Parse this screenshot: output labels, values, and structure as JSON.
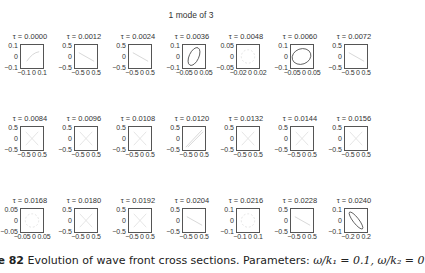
{
  "figure": {
    "suptitle": "1 mode of 3",
    "caption_label": "re 82",
    "caption_text": "Evolution of wave front cross sections. Parameters:",
    "caption_params": "ω/k₁ = 0.1, ω/k₂ = 0"
  },
  "chart_data": {
    "type": "line",
    "title": "1 mode of 3",
    "layout": "3 rows x 7 columns of small subplots",
    "xlabel": "",
    "ylabel": "",
    "grid": false,
    "panels": [
      {
        "title": "τ = 0.0000",
        "yticks": [
          "0.1",
          "0",
          "−0.1"
        ],
        "xticks": "−0.1 0 0.1",
        "shape": "faint-curve"
      },
      {
        "title": "τ = 0.0012",
        "yticks": [
          "0.5",
          "0",
          "−0.5"
        ],
        "xticks": "−0.5 0 0.5",
        "shape": "faint-line"
      },
      {
        "title": "τ = 0.0024",
        "yticks": [
          "0.5",
          "0",
          "−0.5"
        ],
        "xticks": "−0.5 0 0.5",
        "shape": "faint-line"
      },
      {
        "title": "τ = 0.0036",
        "yticks": [
          "0.1",
          "0",
          "−0.1"
        ],
        "xticks": "−0.05 0 0.05",
        "shape": "ellipse-tilted"
      },
      {
        "title": "τ = 0.0048",
        "yticks": [
          "0.05",
          "0",
          "−0.05"
        ],
        "xticks": "−0.02 0 0.02",
        "shape": "faint-ring"
      },
      {
        "title": "τ = 0.0060",
        "yticks": [
          "0.1",
          "0",
          "−0.1"
        ],
        "xticks": "−0.05 0 0.05",
        "shape": "ellipse-wide"
      },
      {
        "title": "τ = 0.0072",
        "yticks": [
          "0.5",
          "0",
          "−0.5"
        ],
        "xticks": "−0.5 0 0.5",
        "shape": "faint-line"
      },
      {
        "title": "τ = 0.0084",
        "yticks": [
          "0.5",
          "0",
          "−0.5"
        ],
        "xticks": "−0.5 0 0.5",
        "shape": "faint-x"
      },
      {
        "title": "τ = 0.0096",
        "yticks": [
          "0.5",
          "0",
          "−0.5"
        ],
        "xticks": "−0.5 0 0.5",
        "shape": "faint-x"
      },
      {
        "title": "τ = 0.0108",
        "yticks": [
          "0.5",
          "0",
          "−0.5"
        ],
        "xticks": "−0.5 0 0.5",
        "shape": "faint-x"
      },
      {
        "title": "τ = 0.0120",
        "yticks": [
          "0.5",
          "0",
          "−0.5"
        ],
        "xticks": "−0.5 0 0.5",
        "shape": "diagonal"
      },
      {
        "title": "τ = 0.0132",
        "yticks": [
          "0.5",
          "0",
          "−0.5"
        ],
        "xticks": "−0.5 0 0.5",
        "shape": "faint-x"
      },
      {
        "title": "τ = 0.0144",
        "yticks": [
          "0.5",
          "0",
          "−0.5"
        ],
        "xticks": "−0.5 0 0.5",
        "shape": "faint-x"
      },
      {
        "title": "τ = 0.0156",
        "yticks": [
          "0.5",
          "0",
          "−0.5"
        ],
        "xticks": "−0.5 0 0.5",
        "shape": "faint-x"
      },
      {
        "title": "τ = 0.0168",
        "yticks": [
          "0.05",
          "0",
          "−0.05"
        ],
        "xticks": "−0.05 0 0.05",
        "shape": "faint-ring"
      },
      {
        "title": "τ = 0.0180",
        "yticks": [
          "0.5",
          "0",
          "−0.5"
        ],
        "xticks": "−0.5 0 0.5",
        "shape": "faint-x"
      },
      {
        "title": "τ = 0.0192",
        "yticks": [
          "0.5",
          "0",
          "−0.5"
        ],
        "xticks": "−0.5 0 0.5",
        "shape": "faint-x"
      },
      {
        "title": "τ = 0.0204",
        "yticks": [
          "0.5",
          "0",
          "−0.5"
        ],
        "xticks": "−0.5 0 0.5",
        "shape": "faint-line"
      },
      {
        "title": "τ = 0.0216",
        "yticks": [
          "0.1",
          "0",
          "−0.1"
        ],
        "xticks": "−0.1 0 0.1",
        "shape": "faint-ring"
      },
      {
        "title": "τ = 0.0228",
        "yticks": [
          "0.5",
          "0",
          "−0.5"
        ],
        "xticks": "−0.5 0 0.5",
        "shape": "faint-line"
      },
      {
        "title": "τ = 0.0240",
        "yticks": [
          "0.1",
          "0",
          "−0.1"
        ],
        "xticks": "−0.2 0 0.2",
        "shape": "ellipse-narrow"
      }
    ]
  }
}
